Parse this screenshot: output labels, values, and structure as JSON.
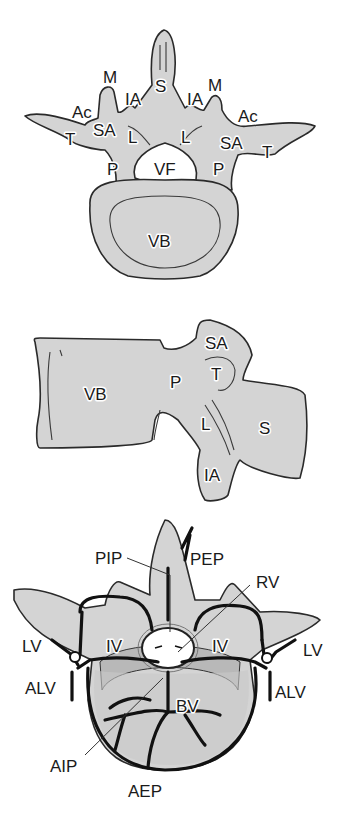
{
  "figure": {
    "panel_top_view": {
      "labels": {
        "S": "S",
        "M_left": "M",
        "M_right": "M",
        "IA_left": "IA",
        "IA_right": "IA",
        "Ac_left": "Ac",
        "Ac_right": "Ac",
        "SA_left": "SA",
        "SA_right": "SA",
        "T_left": "T",
        "T_right": "T",
        "L_left": "L",
        "L_right": "L",
        "P_left": "P",
        "P_right": "P",
        "VF": "VF",
        "VB": "VB"
      }
    },
    "panel_lateral_view": {
      "labels": {
        "VB": "VB",
        "P": "P",
        "SA": "SA",
        "T": "T",
        "L": "L",
        "S": "S",
        "IA": "IA"
      }
    },
    "panel_venous_view": {
      "labels": {
        "PIP": "PIP",
        "PEP": "PEP",
        "RV": "RV",
        "LV_left": "LV",
        "LV_right": "LV",
        "IV_left": "IV",
        "IV_right": "IV",
        "ALV_left": "ALV",
        "ALV_right": "ALV",
        "BV": "BV",
        "AIP": "AIP",
        "AEP": "AEP"
      }
    },
    "colors": {
      "bone_fill": "#d4d4d4",
      "outline": "#2a2a2a",
      "vein": "#111111",
      "background": "#ffffff"
    }
  }
}
